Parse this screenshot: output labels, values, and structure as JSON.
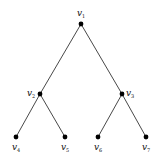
{
  "diagram": {
    "type": "binary-tree",
    "colors": {
      "edge": "#333333",
      "node": "#000000",
      "background": "#ffffff"
    },
    "nodes": [
      {
        "id": "v1",
        "label": "v",
        "sub": "1",
        "x": 81,
        "y": 24,
        "lx": 77,
        "ly": 16
      },
      {
        "id": "v2",
        "label": "v",
        "sub": "2",
        "x": 40,
        "y": 94,
        "lx": 27,
        "ly": 96
      },
      {
        "id": "v3",
        "label": "v",
        "sub": "3",
        "x": 122,
        "y": 94,
        "lx": 126,
        "ly": 96
      },
      {
        "id": "v4",
        "label": "v",
        "sub": "4",
        "x": 16,
        "y": 137,
        "lx": 12,
        "ly": 150
      },
      {
        "id": "v5",
        "label": "v",
        "sub": "5",
        "x": 65,
        "y": 137,
        "lx": 61,
        "ly": 150
      },
      {
        "id": "v6",
        "label": "v",
        "sub": "6",
        "x": 98,
        "y": 137,
        "lx": 94,
        "ly": 150
      },
      {
        "id": "v7",
        "label": "v",
        "sub": "7",
        "x": 146,
        "y": 137,
        "lx": 142,
        "ly": 150
      }
    ],
    "edges": [
      [
        "v1",
        "v2"
      ],
      [
        "v1",
        "v3"
      ],
      [
        "v2",
        "v4"
      ],
      [
        "v2",
        "v5"
      ],
      [
        "v3",
        "v6"
      ],
      [
        "v3",
        "v7"
      ]
    ]
  }
}
